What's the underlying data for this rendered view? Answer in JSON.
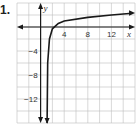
{
  "problem": {
    "number_label": "1."
  },
  "chart_data": {
    "type": "line",
    "title": "",
    "xlabel": "x",
    "ylabel": "y",
    "xlim": [
      -4,
      16
    ],
    "ylim": [
      -16,
      4
    ],
    "grid": true,
    "grid_step": 2,
    "x_ticks": [
      {
        "value": 4,
        "label": "4"
      },
      {
        "value": 8,
        "label": "8"
      },
      {
        "value": 12,
        "label": "12"
      }
    ],
    "y_ticks": [
      {
        "value": -4,
        "label": "−4"
      },
      {
        "value": -8,
        "label": "−8"
      },
      {
        "value": -12,
        "label": "−12"
      }
    ],
    "series": [
      {
        "name": "curve",
        "description": "Logarithmic-type curve with vertical asymptote near x = 1, decreasing without bound as x approaches 1 from the right, increasing slowly to the right",
        "vertical_asymptote_x": 1,
        "points": [
          {
            "x": 1.1,
            "y": -16
          },
          {
            "x": 1.2,
            "y": -6
          },
          {
            "x": 1.5,
            "y": -2
          },
          {
            "x": 2,
            "y": -0.3
          },
          {
            "x": 3,
            "y": 0.6
          },
          {
            "x": 4,
            "y": 1
          },
          {
            "x": 8,
            "y": 1.6
          },
          {
            "x": 12,
            "y": 2
          },
          {
            "x": 15.5,
            "y": 2.3
          }
        ]
      }
    ]
  }
}
